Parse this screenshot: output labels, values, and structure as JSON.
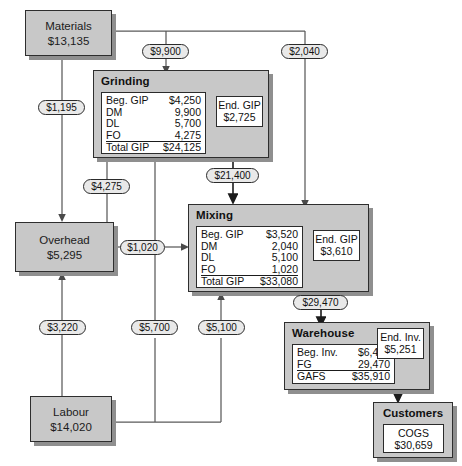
{
  "diagram": {
    "colors": {
      "box_fill": "#c8c8c8",
      "table_fill": "#ffffff",
      "line": "#5a5a5a",
      "text": "#111111",
      "shadow": "#8f8f8f"
    }
  },
  "resources": {
    "materials": {
      "name": "Materials",
      "amount": "$13,135"
    },
    "overhead": {
      "name": "Overhead",
      "amount": "$5,295"
    },
    "labour": {
      "name": "Labour",
      "amount": "$14,020"
    }
  },
  "departments": {
    "grinding": {
      "name": "Grinding",
      "rows": [
        {
          "label": "Beg. GIP",
          "value": "$4,250"
        },
        {
          "label": "DM",
          "value": "9,900"
        },
        {
          "label": "DL",
          "value": "5,700"
        },
        {
          "label": "FO",
          "value": "4,275"
        },
        {
          "label": "Total GIP",
          "value": "$24,125"
        }
      ],
      "ending": {
        "label": "End. GIP",
        "value": "$2,725"
      }
    },
    "mixing": {
      "name": "Mixing",
      "rows": [
        {
          "label": "Beg. GIP",
          "value": "$3,520"
        },
        {
          "label": "DM",
          "value": "2,040"
        },
        {
          "label": "DL",
          "value": "5,100"
        },
        {
          "label": "FO",
          "value": "1,020"
        },
        {
          "label": "Total GIP",
          "value": "$33,080"
        }
      ],
      "ending": {
        "label": "End. GIP",
        "value": "$3,610"
      }
    },
    "warehouse": {
      "name": "Warehouse",
      "rows": [
        {
          "label": "Beg. Inv.",
          "value": "$6,440"
        },
        {
          "label": "FG",
          "value": "29,470"
        },
        {
          "label": "GAFS",
          "value": "$35,910"
        }
      ],
      "ending": {
        "label": "End. Inv.",
        "value": "$5,251"
      }
    },
    "customers": {
      "name": "Customers",
      "rows": [
        {
          "label": "COGS",
          "value": "$30,659"
        }
      ]
    }
  },
  "flows": [
    {
      "id": "mat-to-grinding",
      "label": "$9,900",
      "from": "materials",
      "to": "grinding"
    },
    {
      "id": "mat-to-mixing",
      "label": "$2,040",
      "from": "materials",
      "to": "mixing"
    },
    {
      "id": "mat-to-overhead",
      "label": "$1,195",
      "from": "materials",
      "to": "overhead"
    },
    {
      "id": "overhead-to-grinding",
      "label": "$4,275",
      "from": "overhead",
      "to": "grinding"
    },
    {
      "id": "overhead-to-mixing",
      "label": "$1,020",
      "from": "overhead",
      "to": "mixing"
    },
    {
      "id": "labour-to-overhead",
      "label": "$3,220",
      "from": "labour",
      "to": "overhead"
    },
    {
      "id": "labour-to-grinding",
      "label": "$5,700",
      "from": "labour",
      "to": "grinding"
    },
    {
      "id": "labour-to-mixing",
      "label": "$5,100",
      "from": "labour",
      "to": "mixing"
    },
    {
      "id": "grinding-to-mixing",
      "label": "$21,400",
      "from": "grinding",
      "to": "mixing"
    },
    {
      "id": "mixing-to-warehouse",
      "label": "$29,470",
      "from": "mixing",
      "to": "warehouse"
    }
  ]
}
